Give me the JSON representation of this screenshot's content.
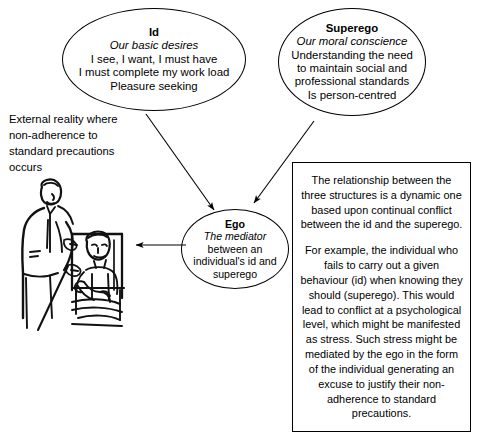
{
  "diagram": {
    "nodes": {
      "id": {
        "title": "Id",
        "subtitle": "Our basic desires",
        "lines": [
          "I see, I want, I must have",
          "I must complete my work load",
          "Pleasure seeking"
        ]
      },
      "superego": {
        "title": "Superego",
        "subtitle": "Our moral conscience",
        "lines": [
          "Understanding the need",
          "to maintain social and",
          "professional standards",
          "Is person-centred"
        ]
      },
      "ego": {
        "title": "Ego",
        "subtitle": "The mediator",
        "lines": [
          "between an",
          "individual's id and",
          "superego"
        ]
      }
    },
    "external_reality": {
      "lines": [
        "External reality where",
        "non-adherence to",
        "standard precautions",
        "occurs"
      ],
      "text": "External reality where non-adherence to standard precautions occurs"
    },
    "explanation": {
      "paragraphs": [
        "The relationship between the three structures is a dynamic one based upon continual conflict between the id and the superego.",
        "For example, the individual who fails to carry out a given behaviour (id) when knowing they should (superego). This would lead to conflict at a psychological level, which might be manifested as stress. Such stress might be mediated by the ego in the form of the individual generating an excuse to justify their non-adherence to standard precautions."
      ]
    },
    "illustration": {
      "caption": "Line drawing of a nurse attending to a seated patient"
    },
    "arrows": [
      {
        "name": "id-to-ego",
        "from": "id",
        "to": "ego"
      },
      {
        "name": "superego-to-ego",
        "from": "superego",
        "to": "ego"
      },
      {
        "name": "ego-to-external-reality",
        "from": "ego",
        "to": "illustration"
      }
    ],
    "colors": {
      "stroke": "#000000",
      "background": "#ffffff"
    }
  }
}
